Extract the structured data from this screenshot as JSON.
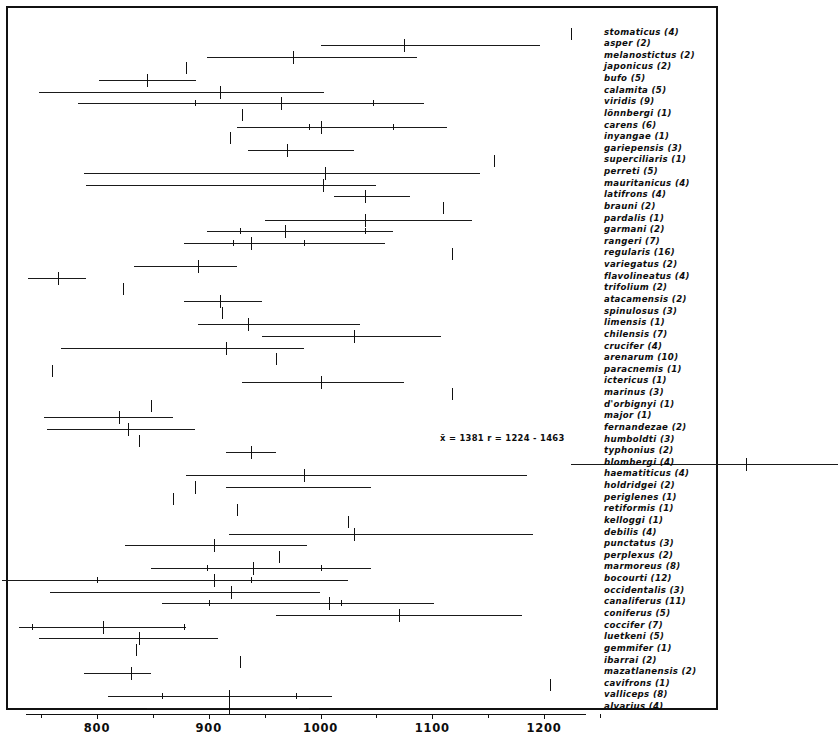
{
  "figure": {
    "type": "range-mean-diagram",
    "frame_visible": true
  },
  "axis": {
    "orientation": "horizontal",
    "min": 720,
    "max": 1240,
    "major_ticks": [
      800,
      900,
      1000,
      1100,
      1200
    ],
    "major_labels": [
      "800",
      "900",
      "1000",
      "1100",
      "1200"
    ],
    "minor_ticks": [
      750,
      850,
      950,
      1050,
      1150,
      1250
    ],
    "tick_label_font_size": 11.5
  },
  "annotation": {
    "text": "x̄ = 1381    r = 1224 - 1463",
    "row_index": 43,
    "x_px": 440,
    "y_px": 433
  },
  "chart_data": {
    "type": "range-mean",
    "title": "",
    "xlabel": "",
    "ylabel": "",
    "xlim": [
      720,
      1240
    ],
    "grid": false,
    "legend": "none",
    "note": "Each row: horizontal line = observed range (r), long vertical tick = mean (x̄), short inner ticks = confidence/standard-deviation limits. Values in parentheses after each species name are sample sizes (n).",
    "rows": [
      {
        "species": "stomaticus",
        "n": 4,
        "mean": 1224,
        "range": null,
        "sd": null
      },
      {
        "species": "asper",
        "n": 2,
        "mean": 1075,
        "range": [
          1000,
          1196
        ],
        "sd": null
      },
      {
        "species": "melanostictus",
        "n": 2,
        "mean": 975,
        "range": [
          898,
          1086
        ],
        "sd": null
      },
      {
        "species": "japonicus",
        "n": 2,
        "mean": 880,
        "range": null,
        "sd": null
      },
      {
        "species": "bufo",
        "n": 5,
        "mean": 845,
        "range": [
          802,
          889
        ],
        "sd": null
      },
      {
        "species": "calamita",
        "n": 5,
        "mean": 910,
        "range": [
          748,
          1003
        ],
        "sd": null
      },
      {
        "species": "viridis",
        "n": 9,
        "mean": 965,
        "range": [
          783,
          1093
        ],
        "sd": [
          888,
          1047
        ]
      },
      {
        "species": "lönnbergi",
        "n": 1,
        "mean": 930,
        "range": null,
        "sd": null
      },
      {
        "species": "carens",
        "n": 6,
        "mean": 1000,
        "range": [
          925,
          1113
        ],
        "sd": [
          990,
          1065
        ]
      },
      {
        "species": "inyangae",
        "n": 1,
        "mean": 919,
        "range": null,
        "sd": null
      },
      {
        "species": "gariepensis",
        "n": 3,
        "mean": 970,
        "range": [
          935,
          1030
        ],
        "sd": null
      },
      {
        "species": "superciliaris",
        "n": 1,
        "mean": 1155,
        "range": null,
        "sd": null
      },
      {
        "species": "perreti",
        "n": 5,
        "mean": 1004,
        "range": [
          788,
          1143
        ],
        "sd": null
      },
      {
        "species": "mauritanicus",
        "n": 4,
        "mean": 1002,
        "range": [
          790,
          1050
        ],
        "sd": null
      },
      {
        "species": "latifrons",
        "n": 4,
        "mean": 1040,
        "range": [
          1012,
          1080
        ],
        "sd": null
      },
      {
        "species": "brauni",
        "n": 2,
        "mean": 1110,
        "range": null,
        "sd": null
      },
      {
        "species": "pardalis",
        "n": 1,
        "mean": 1040,
        "range": [
          950,
          1136
        ],
        "sd": null
      },
      {
        "species": "garmani",
        "n": 2,
        "mean": 968,
        "range": [
          898,
          1065
        ],
        "sd": [
          928,
          1040
        ]
      },
      {
        "species": "rangeri",
        "n": 7,
        "mean": 938,
        "range": [
          878,
          1058
        ],
        "sd": [
          922,
          985
        ]
      },
      {
        "species": "regularis",
        "n": 16,
        "mean": 1118,
        "range": null,
        "sd": null
      },
      {
        "species": "variegatus",
        "n": 2,
        "mean": 890,
        "range": [
          833,
          925
        ],
        "sd": null
      },
      {
        "species": "flavolineatus",
        "n": 4,
        "mean": 765,
        "range": [
          738,
          790
        ],
        "sd": null
      },
      {
        "species": "trifolium",
        "n": 2,
        "mean": 823,
        "range": null,
        "sd": null
      },
      {
        "species": "atacamensis",
        "n": 2,
        "mean": 910,
        "range": [
          878,
          948
        ],
        "sd": null
      },
      {
        "species": "spinulosus",
        "n": 3,
        "mean": 912,
        "range": null,
        "sd": null
      },
      {
        "species": "limensis",
        "n": 1,
        "mean": 935,
        "range": [
          890,
          1035
        ],
        "sd": null
      },
      {
        "species": "chilensis",
        "n": 7,
        "mean": 1030,
        "range": [
          948,
          1108
        ],
        "sd": null
      },
      {
        "species": "crucifer",
        "n": 4,
        "mean": 915,
        "range": [
          768,
          985
        ],
        "sd": null
      },
      {
        "species": "arenarum",
        "n": 10,
        "mean": 960,
        "range": null,
        "sd": null
      },
      {
        "species": "paracnemis",
        "n": 1,
        "mean": 760,
        "range": null,
        "sd": null
      },
      {
        "species": "ictericus",
        "n": 1,
        "mean": 1000,
        "range": [
          930,
          1075
        ],
        "sd": null
      },
      {
        "species": "marinus",
        "n": 3,
        "mean": 1118,
        "range": null,
        "sd": null
      },
      {
        "species": "d'orbignyi",
        "n": 1,
        "mean": 848,
        "range": null,
        "sd": null
      },
      {
        "species": "major",
        "n": 1,
        "mean": 820,
        "range": [
          753,
          868
        ],
        "sd": null
      },
      {
        "species": "fernandezae",
        "n": 2,
        "mean": 828,
        "range": [
          755,
          888
        ],
        "sd": null
      },
      {
        "species": "humboldti",
        "n": 3,
        "mean": 838,
        "range": null,
        "sd": null
      },
      {
        "species": "typhonius",
        "n": 2,
        "mean": 938,
        "range": [
          915,
          960
        ],
        "sd": null
      },
      {
        "species": "blombergi",
        "n": 4,
        "mean": 1381,
        "range": [
          1224,
          1463
        ],
        "sd": null
      },
      {
        "species": "haematiticus",
        "n": 4,
        "mean": 985,
        "range": [
          880,
          1185
        ],
        "sd": null
      },
      {
        "species": "holdridgei",
        "n": 2,
        "mean": 888,
        "range": [
          915,
          1045
        ],
        "sd": null
      },
      {
        "species": "periglenes",
        "n": 1,
        "mean": 868,
        "range": null,
        "sd": null
      },
      {
        "species": "retiformis",
        "n": 1,
        "mean": 925,
        "range": null,
        "sd": null
      },
      {
        "species": "kelloggi",
        "n": 1,
        "mean": 1025,
        "range": null,
        "sd": null
      },
      {
        "species": "debilis",
        "n": 4,
        "mean": 1030,
        "range": [
          918,
          1190
        ],
        "sd": null
      },
      {
        "species": "punctatus",
        "n": 3,
        "mean": 905,
        "range": [
          825,
          988
        ],
        "sd": null
      },
      {
        "species": "perplexus",
        "n": 2,
        "mean": 963,
        "range": null,
        "sd": null
      },
      {
        "species": "marmoreus",
        "n": 8,
        "mean": 940,
        "range": [
          848,
          1045
        ],
        "sd": [
          898,
          1000
        ]
      },
      {
        "species": "bocourti",
        "n": 12,
        "mean": 905,
        "range": [
          715,
          1025
        ],
        "sd": [
          800,
          938
        ]
      },
      {
        "species": "occidentalis",
        "n": 3,
        "mean": 920,
        "range": [
          758,
          1000
        ],
        "sd": null
      },
      {
        "species": "canaliferus",
        "n": 11,
        "mean": 1008,
        "range": [
          858,
          1102
        ],
        "sd": [
          900,
          1018
        ]
      },
      {
        "species": "coniferus",
        "n": 5,
        "mean": 1070,
        "range": [
          960,
          1180
        ],
        "sd": null
      },
      {
        "species": "coccifer",
        "n": 7,
        "mean": 805,
        "range": [
          730,
          880
        ],
        "sd": [
          742,
          878
        ]
      },
      {
        "species": "luetkeni",
        "n": 5,
        "mean": 838,
        "range": [
          748,
          908
        ],
        "sd": null
      },
      {
        "species": "gemmifer",
        "n": 1,
        "mean": 835,
        "range": null,
        "sd": null
      },
      {
        "species": "ibarrai",
        "n": 2,
        "mean": 928,
        "range": null,
        "sd": null
      },
      {
        "species": "mazatlanensis",
        "n": 2,
        "mean": 830,
        "range": [
          788,
          848
        ],
        "sd": null
      },
      {
        "species": "cavifrons",
        "n": 1,
        "mean": 1205,
        "range": null,
        "sd": null
      },
      {
        "species": "valliceps",
        "n": 8,
        "mean": 918,
        "range": [
          810,
          1010
        ],
        "sd": [
          858,
          978
        ]
      },
      {
        "species": "alvarius",
        "n": 4,
        "mean": 918,
        "range": [
          845,
          990
        ],
        "sd": null
      }
    ]
  },
  "labels": [
    "stomaticus (4)",
    "asper (2)",
    "melanostictus (2)",
    "japonicus (2)",
    "bufo (5)",
    "calamita (5)",
    "viridis (9)",
    "lönnbergi (1)",
    "carens (6)",
    "inyangae (1)",
    "gariepensis (3)",
    "superciliaris (1)",
    "perreti (5)",
    "mauritanicus (4)",
    "latifrons (4)",
    "brauni (2)",
    "pardalis (1)",
    "garmani (2)",
    "rangeri (7)",
    "regularis (16)",
    "variegatus (2)",
    "flavolineatus (4)",
    "trifolium (2)",
    "atacamensis (2)",
    "spinulosus (3)",
    "limensis (1)",
    "chilensis (7)",
    "crucifer (4)",
    "arenarum (10)",
    "paracnemis (1)",
    "ictericus (1)",
    "marinus (3)",
    "d'orbignyi (1)",
    "major (1)",
    "fernandezae (2)",
    "humboldti (3)",
    "typhonius (2)",
    "blombergi (4)",
    "haematiticus (4)",
    "holdridgei (2)",
    "periglenes (1)",
    "retiformis (1)",
    "kelloggi (1)",
    "debilis (4)",
    "punctatus (3)",
    "perplexus (2)",
    "marmoreus (8)",
    "bocourti (12)",
    "occidentalis (3)",
    "canaliferus (11)",
    "coniferus (5)",
    "coccifer (7)",
    "luetkeni (5)",
    "gemmifer (1)",
    "ibarrai (2)",
    "mazatlanensis (2)",
    "cavifrons (1)",
    "valliceps (8)",
    "alvarius (4)"
  ]
}
